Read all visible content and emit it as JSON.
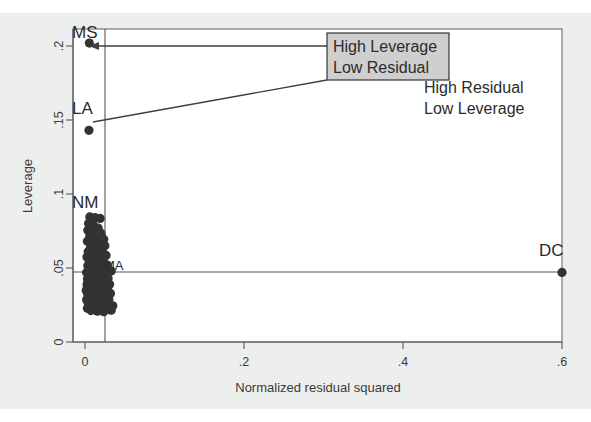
{
  "chart_data": {
    "type": "scatter",
    "title": "",
    "xlabel": "Normalized residual squared",
    "ylabel": "Leverage",
    "xlim": [
      -0.02,
      0.63
    ],
    "ylim": [
      -0.012,
      0.213
    ],
    "xticks": [
      0,
      0.2,
      0.4,
      0.6
    ],
    "xticklabels": [
      "0",
      ".2",
      ".4",
      ".6"
    ],
    "yticks": [
      0,
      0.05,
      0.1,
      0.15,
      0.2
    ],
    "yticklabels": [
      "0",
      ".05",
      ".1",
      ".15",
      ".2"
    ],
    "grid": false,
    "legend": null,
    "reference_lines": [
      {
        "orientation": "vertical",
        "value": 0.0185,
        "note": "mean normalized residual squared"
      },
      {
        "orientation": "horizontal",
        "value": 0.0405,
        "note": "mean leverage"
      }
    ],
    "annotations": [
      {
        "text": "High Leverage\nLow Residual",
        "lines": [
          "High Leverage",
          "Low Residual"
        ],
        "boxed": true,
        "box_fill": "#cfcfcf",
        "x": 0.295,
        "y": 0.189,
        "points_to": [
          "MS",
          "LA"
        ]
      },
      {
        "text": "High Residual\nLow Leverage",
        "lines": [
          "High Residual",
          "Low Leverage"
        ],
        "boxed": false,
        "x": 0.47,
        "y": 0.163,
        "points_to": []
      }
    ],
    "labeled_points": [
      {
        "label": "MS",
        "x": 0.0055,
        "y": 0.202
      },
      {
        "label": "LA",
        "x": 0.005,
        "y": 0.143
      },
      {
        "label": "NM",
        "x": 0.006,
        "y": 0.0845
      },
      {
        "label": "MA",
        "x": 0.033,
        "y": 0.048
      },
      {
        "label": "DC",
        "x": 0.6,
        "y": 0.047
      }
    ],
    "points": [
      {
        "x": 0.0055,
        "y": 0.202
      },
      {
        "x": 0.005,
        "y": 0.143
      },
      {
        "x": 0.006,
        "y": 0.0845
      },
      {
        "x": 0.0125,
        "y": 0.084
      },
      {
        "x": 0.019,
        "y": 0.0835
      },
      {
        "x": 0.0045,
        "y": 0.08
      },
      {
        "x": 0.0105,
        "y": 0.079
      },
      {
        "x": 0.0165,
        "y": 0.077
      },
      {
        "x": 0.0035,
        "y": 0.0755
      },
      {
        "x": 0.009,
        "y": 0.0745
      },
      {
        "x": 0.02,
        "y": 0.0735
      },
      {
        "x": 0.006,
        "y": 0.0715
      },
      {
        "x": 0.014,
        "y": 0.0705
      },
      {
        "x": 0.0235,
        "y": 0.0695
      },
      {
        "x": 0.003,
        "y": 0.068
      },
      {
        "x": 0.011,
        "y": 0.067
      },
      {
        "x": 0.018,
        "y": 0.066
      },
      {
        "x": 0.025,
        "y": 0.065
      },
      {
        "x": 0.007,
        "y": 0.064
      },
      {
        "x": 0.015,
        "y": 0.063
      },
      {
        "x": 0.0215,
        "y": 0.062
      },
      {
        "x": 0.004,
        "y": 0.061
      },
      {
        "x": 0.012,
        "y": 0.06
      },
      {
        "x": 0.0195,
        "y": 0.0595
      },
      {
        "x": 0.0265,
        "y": 0.0585
      },
      {
        "x": 0.0025,
        "y": 0.0575
      },
      {
        "x": 0.0085,
        "y": 0.057
      },
      {
        "x": 0.016,
        "y": 0.056
      },
      {
        "x": 0.023,
        "y": 0.055
      },
      {
        "x": 0.0055,
        "y": 0.0545
      },
      {
        "x": 0.013,
        "y": 0.0535
      },
      {
        "x": 0.0205,
        "y": 0.0528
      },
      {
        "x": 0.028,
        "y": 0.052
      },
      {
        "x": 0.0035,
        "y": 0.0515
      },
      {
        "x": 0.01,
        "y": 0.0508
      },
      {
        "x": 0.017,
        "y": 0.0502
      },
      {
        "x": 0.0245,
        "y": 0.0495
      },
      {
        "x": 0.033,
        "y": 0.048
      },
      {
        "x": 0.0065,
        "y": 0.0488
      },
      {
        "x": 0.014,
        "y": 0.0482
      },
      {
        "x": 0.0215,
        "y": 0.0475
      },
      {
        "x": 0.002,
        "y": 0.047
      },
      {
        "x": 0.0095,
        "y": 0.0465
      },
      {
        "x": 0.0175,
        "y": 0.0458
      },
      {
        "x": 0.0255,
        "y": 0.0452
      },
      {
        "x": 0.0045,
        "y": 0.0448
      },
      {
        "x": 0.012,
        "y": 0.0442
      },
      {
        "x": 0.02,
        "y": 0.0436
      },
      {
        "x": 0.029,
        "y": 0.043
      },
      {
        "x": 0.003,
        "y": 0.0425
      },
      {
        "x": 0.0105,
        "y": 0.042
      },
      {
        "x": 0.0185,
        "y": 0.0415
      },
      {
        "x": 0.0265,
        "y": 0.041
      },
      {
        "x": 0.006,
        "y": 0.0405
      },
      {
        "x": 0.014,
        "y": 0.04
      },
      {
        "x": 0.0225,
        "y": 0.0395
      },
      {
        "x": 0.031,
        "y": 0.039
      },
      {
        "x": 0.0025,
        "y": 0.0388
      },
      {
        "x": 0.009,
        "y": 0.0383
      },
      {
        "x": 0.0165,
        "y": 0.0378
      },
      {
        "x": 0.0245,
        "y": 0.0373
      },
      {
        "x": 0.0045,
        "y": 0.0368
      },
      {
        "x": 0.0125,
        "y": 0.0363
      },
      {
        "x": 0.0205,
        "y": 0.0358
      },
      {
        "x": 0.0285,
        "y": 0.0353
      },
      {
        "x": 0.0015,
        "y": 0.0348
      },
      {
        "x": 0.008,
        "y": 0.0343
      },
      {
        "x": 0.0155,
        "y": 0.0338
      },
      {
        "x": 0.0235,
        "y": 0.0333
      },
      {
        "x": 0.032,
        "y": 0.0328
      },
      {
        "x": 0.0035,
        "y": 0.0323
      },
      {
        "x": 0.011,
        "y": 0.0318
      },
      {
        "x": 0.019,
        "y": 0.0313
      },
      {
        "x": 0.027,
        "y": 0.0308
      },
      {
        "x": 0.0055,
        "y": 0.0303
      },
      {
        "x": 0.0135,
        "y": 0.0298
      },
      {
        "x": 0.0215,
        "y": 0.0293
      },
      {
        "x": 0.03,
        "y": 0.0288
      },
      {
        "x": 0.002,
        "y": 0.0285
      },
      {
        "x": 0.0095,
        "y": 0.028
      },
      {
        "x": 0.017,
        "y": 0.0275
      },
      {
        "x": 0.025,
        "y": 0.027
      },
      {
        "x": 0.004,
        "y": 0.0265
      },
      {
        "x": 0.0115,
        "y": 0.026
      },
      {
        "x": 0.0195,
        "y": 0.0255
      },
      {
        "x": 0.0275,
        "y": 0.025
      },
      {
        "x": 0.035,
        "y": 0.0245
      },
      {
        "x": 0.0065,
        "y": 0.0242
      },
      {
        "x": 0.0145,
        "y": 0.0238
      },
      {
        "x": 0.0225,
        "y": 0.0234
      },
      {
        "x": 0.0305,
        "y": 0.023
      },
      {
        "x": 0.003,
        "y": 0.0228
      },
      {
        "x": 0.0105,
        "y": 0.0224
      },
      {
        "x": 0.0185,
        "y": 0.022
      },
      {
        "x": 0.026,
        "y": 0.0218
      },
      {
        "x": 0.033,
        "y": 0.0215
      },
      {
        "x": 0.0075,
        "y": 0.0212
      },
      {
        "x": 0.0155,
        "y": 0.0208
      },
      {
        "x": 0.0235,
        "y": 0.0205
      },
      {
        "x": 0.6,
        "y": 0.047
      }
    ]
  },
  "figure": {
    "axis_title_y": "Leverage",
    "axis_title_x": "Normalized residual squared",
    "tick_x": [
      "0",
      ".2",
      ".4",
      ".6"
    ],
    "tick_y": [
      "0",
      ".05",
      ".1",
      ".15",
      ".2"
    ],
    "annotation_boxed_line1": "High Leverage",
    "annotation_boxed_line2": "Low Residual",
    "annotation_plain_line1": "High Residual",
    "annotation_plain_line2": "Low Leverage",
    "point_label_ms": "MS",
    "point_label_la": "LA",
    "point_label_nm": "NM",
    "point_label_ma": "MA",
    "point_label_dc": "DC"
  },
  "colors": {
    "marker": "#333333",
    "frame": "#6d6d6d",
    "text": "#3a3a3a",
    "annotation_box_fill": "#cfcfcf",
    "annotation_box_stroke": "#333333",
    "page_background": "#edeeee"
  }
}
